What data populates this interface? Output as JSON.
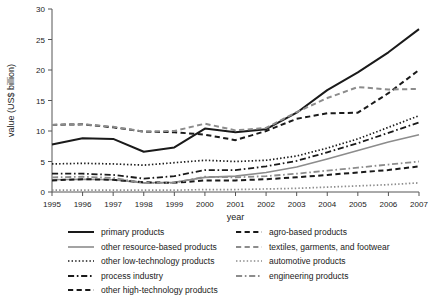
{
  "chart_data": {
    "type": "line",
    "title": "",
    "xlabel": "year",
    "ylabel": "value (US$ billion)",
    "x": [
      1995,
      1996,
      1997,
      1998,
      1999,
      2000,
      2001,
      2002,
      2003,
      2004,
      2005,
      2006,
      2007
    ],
    "xtick_labels": [
      "1995",
      "1996",
      "1997",
      "1998",
      "1999",
      "2000",
      "2001",
      "2002",
      "2003",
      "2004",
      "2005",
      "2006",
      "2007"
    ],
    "ytick_labels": [
      "0",
      "5",
      "10",
      "15",
      "20",
      "25",
      "30"
    ],
    "yticks": [
      0,
      5,
      10,
      15,
      20,
      25,
      30
    ],
    "xlim": [
      1995,
      2007
    ],
    "ylim": [
      0,
      30
    ],
    "grid": false,
    "legend_position": "below",
    "series": [
      {
        "name": "primary products",
        "style": "solid",
        "color": "#1a1a1a",
        "width": 2.0,
        "values": [
          7.8,
          8.8,
          8.7,
          6.6,
          7.3,
          10.4,
          9.8,
          10.3,
          13.0,
          16.7,
          19.6,
          22.9,
          26.7
        ]
      },
      {
        "name": "other resource-based products",
        "style": "solid",
        "color": "#8c8c8c",
        "width": 1.6,
        "values": [
          2.0,
          2.1,
          2.0,
          1.5,
          1.6,
          2.4,
          2.6,
          3.2,
          4.1,
          5.4,
          6.8,
          8.2,
          9.4
        ]
      },
      {
        "name": "other low-technology products",
        "style": "dotted",
        "color": "#1a1a1a",
        "width": 1.7,
        "values": [
          4.6,
          4.7,
          4.6,
          4.4,
          4.8,
          5.2,
          5.0,
          5.2,
          5.9,
          7.2,
          8.7,
          10.6,
          12.5
        ]
      },
      {
        "name": "process industry",
        "style": "dashdot",
        "color": "#1a1a1a",
        "width": 1.8,
        "values": [
          3.0,
          3.0,
          2.8,
          2.2,
          2.6,
          3.6,
          3.6,
          4.2,
          5.1,
          6.5,
          8.0,
          9.7,
          11.4
        ]
      },
      {
        "name": "other high-technology products",
        "style": "dashed",
        "color": "#1a1a1a",
        "width": 2.0,
        "values": [
          1.9,
          2.1,
          2.0,
          1.6,
          1.5,
          1.9,
          1.9,
          2.1,
          2.4,
          2.8,
          3.2,
          3.6,
          4.2
        ]
      },
      {
        "name": "agro-based products",
        "style": "dashed",
        "color": "#1a1a1a",
        "width": 2.0,
        "values": [
          11.0,
          11.1,
          10.6,
          9.9,
          9.8,
          9.4,
          8.5,
          10.0,
          12.0,
          12.9,
          13.0,
          16.2,
          20.0
        ]
      },
      {
        "name": "textiles, garments, and footwear",
        "style": "dashed",
        "color": "#8c8c8c",
        "width": 2.0,
        "values": [
          11.0,
          11.1,
          10.7,
          9.9,
          10.0,
          11.2,
          10.1,
          10.5,
          13.1,
          15.4,
          17.2,
          16.8,
          16.9
        ]
      },
      {
        "name": "automotive products",
        "style": "dotted",
        "color": "#8c8c8c",
        "width": 1.7,
        "values": [
          0.3,
          0.3,
          0.3,
          0.3,
          0.3,
          0.4,
          0.4,
          0.5,
          0.6,
          0.8,
          1.0,
          1.2,
          1.5
        ]
      },
      {
        "name": "engineering products",
        "style": "dashdot",
        "color": "#8c8c8c",
        "width": 1.8,
        "values": [
          2.4,
          2.5,
          2.3,
          1.5,
          1.5,
          2.5,
          2.4,
          2.6,
          3.0,
          3.5,
          4.0,
          4.5,
          5.0
        ]
      }
    ]
  },
  "legend": {
    "left_items": [
      {
        "label": "primary products",
        "series": 0
      },
      {
        "label": "other resource-based products",
        "series": 1
      },
      {
        "label": "other low-technology products",
        "series": 2
      },
      {
        "label": "process industry",
        "series": 3
      },
      {
        "label": "other high-technology products",
        "series": 4
      }
    ],
    "right_items": [
      {
        "label": "agro-based products",
        "series": 5
      },
      {
        "label": "textiles, garments, and footwear",
        "series": 6
      },
      {
        "label": "automotive products",
        "series": 7
      },
      {
        "label": "engineering products",
        "series": 8
      }
    ]
  }
}
